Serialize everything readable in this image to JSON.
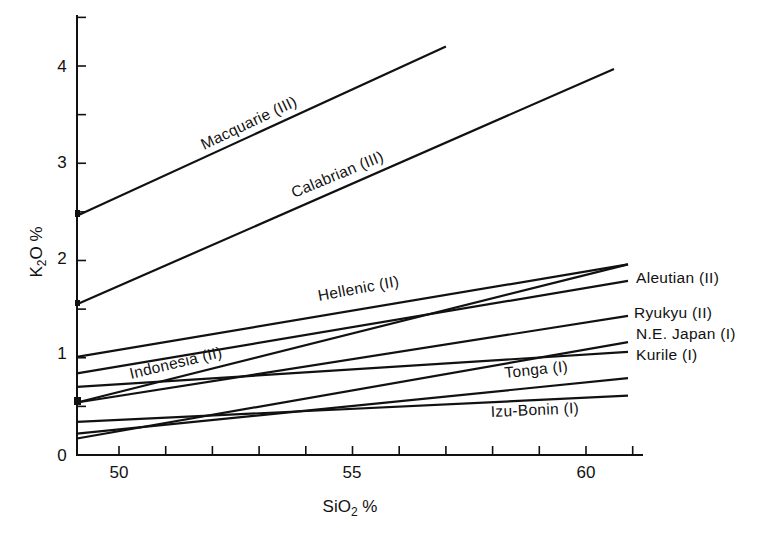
{
  "chart_data": {
    "type": "line",
    "title": "",
    "xlabel": "SiO2 %",
    "ylabel": "K2O %",
    "xlim": [
      49.1,
      61.2
    ],
    "ylim": [
      0,
      4.5
    ],
    "x_ticks_major": [
      50,
      55,
      60
    ],
    "x_ticks_minor_step": 1,
    "y_ticks_major": [
      0,
      1,
      2,
      3,
      4
    ],
    "y_ticks_minor_step": 0.5,
    "grid": false,
    "legend": "inline labels at line ends / along lines",
    "series": [
      {
        "name": "Macquarie (III)",
        "x": [
          49.1,
          57.0
        ],
        "y": [
          2.46,
          4.2
        ]
      },
      {
        "name": "Calabrian (III)",
        "x": [
          49.1,
          60.6
        ],
        "y": [
          1.55,
          3.97
        ]
      },
      {
        "name": "Hellenic (II)",
        "x": [
          49.1,
          60.9
        ],
        "y": [
          1.01,
          1.96
        ]
      },
      {
        "name": "Aleutian (II)",
        "x": [
          49.1,
          60.9
        ],
        "y": [
          0.84,
          1.79
        ]
      },
      {
        "name": "Indonesia (II)",
        "x": [
          49.1,
          60.9
        ],
        "y": [
          0.54,
          1.96
        ]
      },
      {
        "name": "Ryukyu (II)",
        "x": [
          49.1,
          60.9
        ],
        "y": [
          0.54,
          1.43
        ]
      },
      {
        "name": "N.E. Japan (I)",
        "x": [
          49.1,
          60.9
        ],
        "y": [
          0.17,
          1.16
        ]
      },
      {
        "name": "Kurile (I)",
        "x": [
          49.1,
          60.9
        ],
        "y": [
          0.7,
          1.06
        ]
      },
      {
        "name": "Tonga (I)",
        "x": [
          49.1,
          60.9
        ],
        "y": [
          0.22,
          0.79
        ]
      },
      {
        "name": "Izu-Bonin (I)",
        "x": [
          49.1,
          60.9
        ],
        "y": [
          0.34,
          0.61
        ]
      }
    ]
  },
  "axes": {
    "x_title_main": "SiO",
    "x_title_sub": "2",
    "x_title_suffix": " %",
    "y_title_main": "K",
    "y_title_sub": "2",
    "y_title_suffix": "O %",
    "x_tick_labels": [
      "50",
      "55",
      "60"
    ],
    "y_tick_labels": [
      "0",
      "1",
      "2",
      "3",
      "4"
    ]
  },
  "labels": {
    "macquarie": "Macquarie (III)",
    "calabrian": "Calabrian (III)",
    "hellenic": "Hellenic (II)",
    "indonesia": "Indonesia (II)",
    "aleutian": "Aleutian (II)",
    "ryukyu": "Ryukyu (II)",
    "ne_japan": "N.E. Japan (I)",
    "kurile": "Kurile (I)",
    "tonga": "Tonga (I)",
    "izu_bonin": "Izu-Bonin (I)"
  },
  "colors": {
    "ink": "#111111",
    "background": "#ffffff"
  }
}
